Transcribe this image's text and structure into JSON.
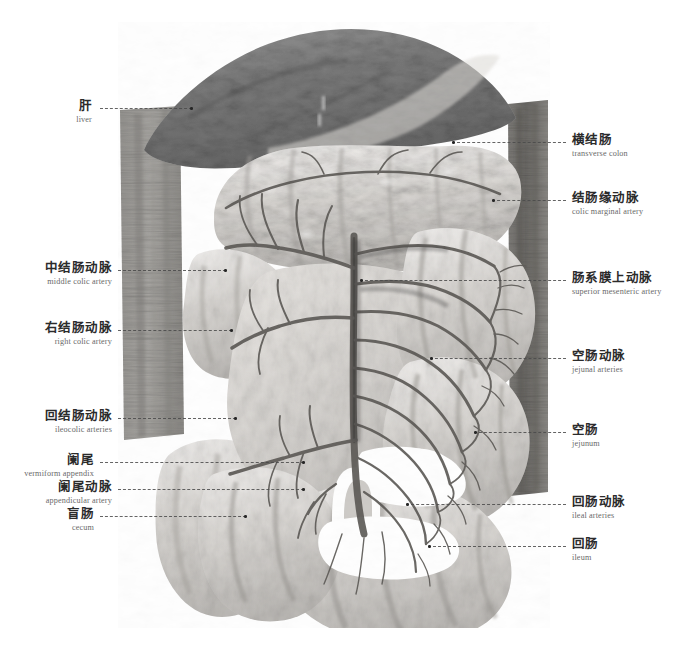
{
  "plate": {
    "title": "Superior mesenteric artery and its branches (cadaveric specimen)",
    "background_color": "#ffffff",
    "label_cn_color": "#2b2b2b",
    "label_en_color": "#6a6a6a",
    "leader_color": "#4a4a4a"
  },
  "labels": {
    "left": [
      {
        "cn": "肝",
        "en": "liver"
      },
      {
        "cn": "中结肠动脉",
        "en": "middle colic artery"
      },
      {
        "cn": "右结肠动脉",
        "en": "right colic artery"
      },
      {
        "cn": "回结肠动脉",
        "en": "ileocolic arteries"
      },
      {
        "cn": "阑尾",
        "en": "vermiform appendix"
      },
      {
        "cn": "阑尾动脉",
        "en": "appendicular artery"
      },
      {
        "cn": "盲肠",
        "en": "cecum"
      }
    ],
    "right": [
      {
        "cn": "横结肠",
        "en": "transverse colon"
      },
      {
        "cn": "结肠缘动脉",
        "en": "colic marginal artery"
      },
      {
        "cn": "肠系膜上动脉",
        "en": "superior mesenteric artery"
      },
      {
        "cn": "空肠动脉",
        "en": "jejunal arteries"
      },
      {
        "cn": "空肠",
        "en": "jejunum"
      },
      {
        "cn": "回肠动脉",
        "en": "ileal arteries"
      },
      {
        "cn": "回肠",
        "en": "ileum"
      }
    ]
  }
}
